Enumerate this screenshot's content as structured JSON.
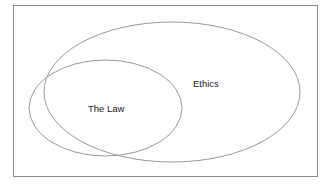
{
  "diagram": {
    "type": "venn",
    "sets": [
      {
        "id": "ethics",
        "label": "Ethics"
      },
      {
        "id": "law",
        "label": "The Law"
      }
    ],
    "colors": {
      "stroke": "#9a9a9a",
      "frame": "#8c8c8c",
      "text": "#222222",
      "background": "#ffffff"
    }
  }
}
